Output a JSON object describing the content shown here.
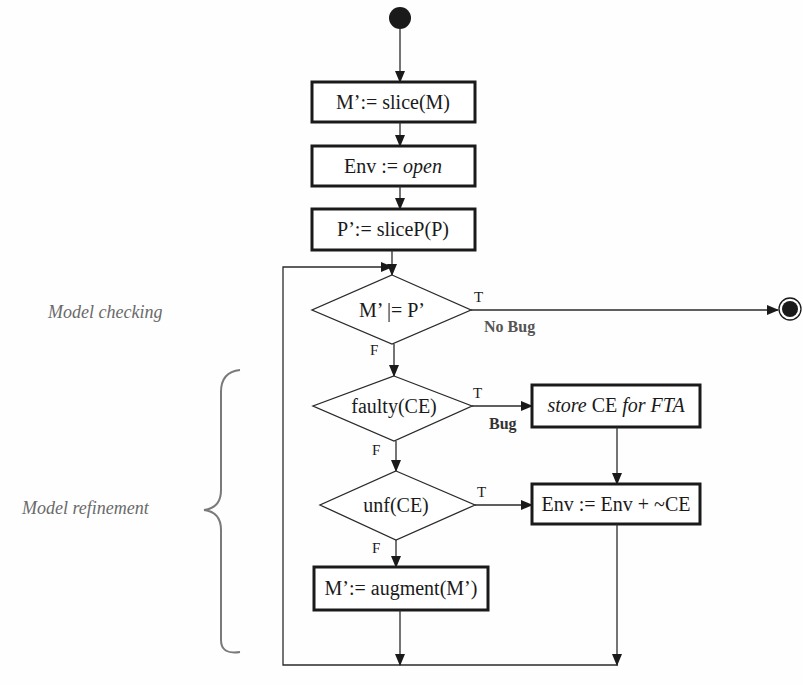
{
  "diagram": {
    "type": "flowchart",
    "start_node": "start-state",
    "end_node": "end-state",
    "nodes": [
      {
        "id": "slice-model",
        "shape": "box",
        "text": "M’:= slice(M)"
      },
      {
        "id": "env-open",
        "shape": "box",
        "text_plain": "Env := ",
        "text_italic": "open"
      },
      {
        "id": "slice-property",
        "shape": "box",
        "text": "P’:= sliceP(P)"
      },
      {
        "id": "model-check",
        "shape": "diamond",
        "text": "M’ |= P’"
      },
      {
        "id": "faulty-check",
        "shape": "diamond",
        "text": "faulty(CE)"
      },
      {
        "id": "store-ce",
        "shape": "box",
        "text_italic_1": "store",
        "text_plain": " CE ",
        "text_italic_2": "for FTA"
      },
      {
        "id": "unf-check",
        "shape": "diamond",
        "text": "unf(CE)"
      },
      {
        "id": "env-update",
        "shape": "box",
        "text": "Env := Env + ~CE"
      },
      {
        "id": "augment-model",
        "shape": "box",
        "text": "M’:= augment(M’)"
      }
    ],
    "edges": {
      "true_label": "T",
      "false_label": "F",
      "no_bug_label": "No Bug",
      "bug_label": "Bug"
    },
    "annotations": {
      "model_checking": "Model checking",
      "model_refinement": "Model refinement"
    },
    "colors": {
      "stroke": "#1a1a1a",
      "annotation_gray": "#6a6a6a",
      "background": "#fefefe"
    }
  }
}
